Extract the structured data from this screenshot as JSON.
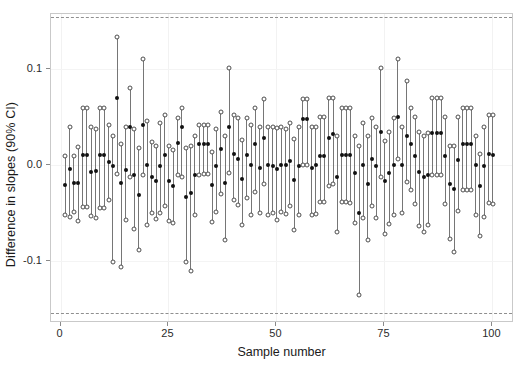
{
  "chart_data": {
    "type": "scatter",
    "title": "",
    "subtitle": "",
    "xlabel": "Sample number",
    "ylabel": "Difference in slopes (90% CI)",
    "xlim": [
      -2.2,
      105.0
    ],
    "ylim": [
      -0.1645,
      0.1575
    ],
    "xticks": [
      0,
      25,
      50,
      75,
      100
    ],
    "xticklabels": [
      "0",
      "25",
      "50",
      "75",
      "100"
    ],
    "yticks": [
      -0.1,
      0.0,
      0.1
    ],
    "yticklabels": [
      "-0.1",
      "0.0",
      "0.1"
    ],
    "grid": true,
    "legend": "none",
    "reference_lines": [
      {
        "name": "upper-reference-line",
        "y": 0.154,
        "style": "dashed",
        "color": "#8f8f8f"
      },
      {
        "name": "lower-reference-line",
        "y": -0.154,
        "style": "dashed",
        "color": "#8f8f8f"
      }
    ],
    "marker_styles": {
      "estimate": "filled-circle",
      "interval_endpoint": "open-circle",
      "interval": "vertical-line"
    },
    "series": [
      {
        "name": "Difference in slopes with 90% CI",
        "x": [
          1,
          2,
          3,
          4,
          5,
          6,
          7,
          8,
          9,
          10,
          11,
          12,
          13,
          14,
          15,
          16,
          17,
          18,
          19,
          20,
          21,
          22,
          23,
          24,
          25,
          26,
          27,
          28,
          29,
          30,
          31,
          32,
          33,
          34,
          35,
          36,
          37,
          38,
          39,
          40,
          41,
          42,
          43,
          44,
          45,
          46,
          47,
          48,
          49,
          50,
          51,
          52,
          53,
          54,
          55,
          56,
          57,
          58,
          59,
          60,
          61,
          62,
          63,
          64,
          65,
          66,
          67,
          68,
          69,
          70,
          71,
          72,
          73,
          74,
          75,
          76,
          77,
          78,
          79,
          80,
          81,
          82,
          83,
          84,
          85,
          86,
          87,
          88,
          89,
          90,
          91,
          92,
          93,
          94,
          95,
          96,
          97,
          98,
          99,
          100
        ],
        "estimate": [
          -0.021,
          -0.004,
          -0.019,
          -0.019,
          0.011,
          0.011,
          -0.007,
          -0.006,
          0.011,
          0.011,
          0.003,
          -0.001,
          0.07,
          -0.019,
          -0.005,
          0.04,
          -0.01,
          -0.031,
          0.042,
          0.0,
          -0.012,
          -0.017,
          -0.001,
          0.011,
          -0.017,
          -0.022,
          0.023,
          0.04,
          -0.033,
          -0.029,
          -0.01,
          0.022,
          0.022,
          0.022,
          -0.021,
          -0.001,
          0.017,
          -0.019,
          0.04,
          0.012,
          0.006,
          -0.014,
          0.011,
          0.0,
          0.022,
          -0.003,
          0.028,
          0.0,
          -0.001,
          -0.004,
          0.0,
          0.0,
          0.004,
          -0.015,
          -0.001,
          0.048,
          0.048,
          -0.003,
          0.0,
          0.01,
          0.01,
          0.028,
          0.032,
          -0.012,
          0.011,
          0.011,
          0.011,
          -0.008,
          -0.05,
          0.0,
          -0.02,
          0.006,
          -0.001,
          0.035,
          -0.017,
          -0.008,
          0.0,
          0.05,
          0.0,
          0.03,
          0.022,
          0.01,
          -0.007,
          -0.012,
          -0.01,
          0.034,
          0.034,
          0.034,
          0.01,
          -0.02,
          -0.025,
          0.005,
          0.022,
          0.022,
          0.022,
          0.0,
          -0.022,
          -0.001,
          0.012,
          0.011,
          0.011
        ],
        "lower": [
          -0.052,
          -0.054,
          -0.049,
          -0.058,
          -0.044,
          -0.044,
          -0.053,
          -0.055,
          -0.045,
          -0.045,
          -0.036,
          -0.101,
          -0.009,
          -0.106,
          -0.057,
          -0.012,
          -0.067,
          -0.088,
          -0.01,
          -0.062,
          -0.05,
          -0.056,
          -0.05,
          -0.043,
          -0.058,
          -0.06,
          -0.01,
          -0.012,
          -0.101,
          -0.11,
          -0.052,
          -0.01,
          -0.009,
          -0.009,
          -0.059,
          -0.049,
          -0.03,
          -0.078,
          -0.008,
          -0.036,
          -0.042,
          -0.062,
          -0.034,
          -0.052,
          -0.028,
          -0.05,
          -0.02,
          -0.052,
          -0.05,
          -0.057,
          -0.049,
          -0.051,
          -0.043,
          -0.068,
          -0.052,
          0.0,
          0.0,
          -0.052,
          -0.051,
          -0.038,
          -0.038,
          -0.022,
          -0.02,
          -0.07,
          -0.038,
          -0.038,
          -0.039,
          -0.06,
          -0.135,
          -0.055,
          -0.078,
          -0.043,
          -0.055,
          -0.012,
          -0.072,
          -0.061,
          -0.052,
          0.006,
          -0.05,
          -0.018,
          -0.026,
          -0.04,
          -0.063,
          -0.07,
          -0.062,
          -0.01,
          -0.01,
          -0.01,
          -0.04,
          -0.077,
          -0.09,
          -0.048,
          -0.026,
          -0.026,
          -0.026,
          -0.052,
          -0.074,
          -0.054,
          -0.039,
          -0.04,
          -0.04
        ],
        "upper": [
          0.01,
          0.04,
          0.01,
          0.019,
          0.06,
          0.06,
          0.04,
          0.038,
          0.06,
          0.06,
          0.042,
          0.03,
          0.134,
          0.022,
          0.04,
          0.08,
          0.038,
          0.018,
          0.111,
          0.046,
          0.024,
          0.02,
          0.044,
          0.052,
          0.02,
          0.016,
          0.049,
          0.06,
          0.018,
          0.02,
          0.03,
          0.042,
          0.042,
          0.042,
          0.014,
          0.038,
          0.055,
          0.03,
          0.101,
          0.052,
          0.049,
          0.026,
          0.049,
          0.042,
          0.06,
          0.04,
          0.069,
          0.04,
          0.04,
          0.039,
          0.04,
          0.038,
          0.044,
          0.027,
          0.04,
          0.069,
          0.069,
          0.04,
          0.04,
          0.05,
          0.05,
          0.07,
          0.07,
          0.03,
          0.06,
          0.06,
          0.06,
          0.03,
          0.02,
          0.044,
          0.03,
          0.049,
          0.04,
          0.101,
          0.025,
          0.035,
          0.049,
          0.111,
          0.04,
          0.088,
          0.06,
          0.05,
          0.035,
          0.03,
          0.034,
          0.07,
          0.07,
          0.07,
          0.05,
          0.02,
          0.02,
          0.05,
          0.06,
          0.06,
          0.06,
          0.03,
          0.012,
          0.04,
          0.052,
          0.052,
          0.052
        ]
      }
    ]
  },
  "axes": {
    "x_title": "Sample number",
    "y_title": "Difference in slopes (90% CI)"
  }
}
